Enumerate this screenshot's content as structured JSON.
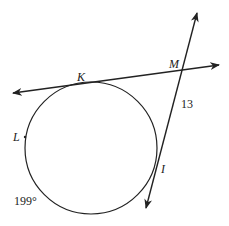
{
  "diagram": {
    "type": "circle-tangent-secant",
    "stroke_color": "#222222",
    "background": "#ffffff",
    "circle": {
      "cx": 91,
      "cy": 148,
      "r": 66
    },
    "points": {
      "K": {
        "label": "K",
        "x": 84,
        "y": 83
      },
      "M": {
        "label": "M",
        "x": 182,
        "y": 71
      },
      "L": {
        "label": "L",
        "x": 25,
        "y": 137
      },
      "I": {
        "label": "I",
        "x": 156,
        "y": 169
      }
    },
    "labels": {
      "K": "K",
      "M": "M",
      "L": "L",
      "I": "I",
      "segment_MI": "13",
      "arc_measure": "199°"
    },
    "lines": [
      {
        "name": "tangent-line-KM",
        "from": [
          13,
          93
        ],
        "to": [
          219,
          65
        ],
        "arrows": "both"
      },
      {
        "name": "secant-line-MI",
        "from": [
          146,
          208
        ],
        "to": [
          197,
          13
        ],
        "arrows": "both"
      }
    ]
  }
}
